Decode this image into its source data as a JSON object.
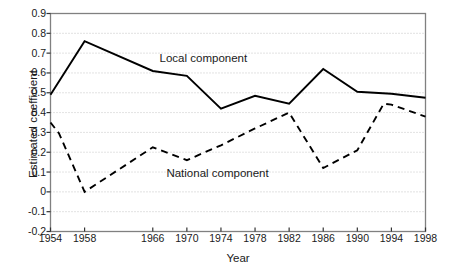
{
  "chart_data": {
    "type": "line",
    "title": "",
    "xlabel": "Year",
    "ylabel": "Estimated coefficient",
    "xlim": [
      1954,
      1998
    ],
    "ylim": [
      -0.2,
      0.9
    ],
    "grid": true,
    "grid_style": "dotted-horizontal",
    "legend": "inline-annotations",
    "y_ticks": [
      "0.9",
      "0.8",
      "0.7",
      "0.6",
      "0.5",
      "0.4",
      "0.3",
      "0.2",
      "0.1",
      "0",
      "-0.1",
      "-0.2"
    ],
    "y_tick_values": [
      0.9,
      0.8,
      0.7,
      0.6,
      0.5,
      0.4,
      0.3,
      0.2,
      0.1,
      0,
      -0.1,
      -0.2
    ],
    "x_ticks": [
      "1954",
      "1958",
      "1966",
      "1970",
      "1974",
      "1978",
      "1982",
      "1986",
      "1990",
      "1994",
      "1998"
    ],
    "x_tick_values": [
      1954,
      1958,
      1962,
      1966,
      1970,
      1974,
      1978,
      1982,
      1986,
      1990,
      1994
    ],
    "x": [
      1954,
      1958,
      1966,
      1970,
      1974,
      1978,
      1982,
      1986,
      1990,
      1994,
      1998
    ],
    "series": [
      {
        "name": "Local component",
        "style": "solid",
        "color": "#000000",
        "values": [
          0.49,
          0.76,
          0.61,
          0.585,
          0.42,
          0.485,
          0.445,
          0.62,
          0.505,
          0.495,
          0.475
        ],
        "label": "Local component",
        "label_x": 1966.8,
        "label_y": 0.655
      },
      {
        "name": "National component",
        "style": "dashed",
        "color": "#000000",
        "values": [
          0.35,
          0.0,
          0.225,
          0.16,
          0.235,
          0.32,
          0.4,
          0.12,
          0.21,
          0.44,
          0.38
        ],
        "extra_points": [
          {
            "x": 1955.0,
            "y": 0.295
          },
          {
            "x": 1993.1,
            "y": 0.445
          }
        ],
        "label": "National component",
        "label_x": 1967.6,
        "label_y": 0.075
      }
    ],
    "annotations": [
      {
        "text": "Local component",
        "series": "Local component"
      },
      {
        "text": "National component",
        "series": "National component"
      }
    ]
  },
  "axes": {
    "frame_color": "#808080",
    "gridline_color": "#b8b8b8",
    "tick_color": "#555555"
  }
}
